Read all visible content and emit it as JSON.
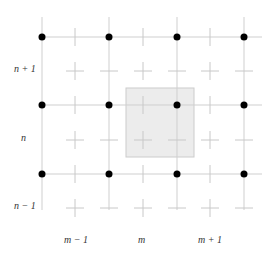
{
  "diagram": {
    "type": "staggered-grid",
    "row_labels": [
      "n + 1",
      "n",
      "n − 1"
    ],
    "column_labels": [
      "m − 1",
      "m",
      "m + 1"
    ],
    "node_columns_x": [
      42,
      109,
      177,
      244
    ],
    "node_rows_y": [
      37,
      105,
      174
    ],
    "cross_columns_x": [
      75,
      143,
      210
    ],
    "cross_rows_y": [
      71,
      140,
      208
    ],
    "highlight_cell": {
      "x": 126,
      "y": 88,
      "w": 68,
      "h": 69,
      "fill": "#ececec",
      "stroke": "#cccccc"
    },
    "colors": {
      "grid_line": "#cfcfcf",
      "node": "#000000",
      "cross": "#c8c8c8"
    }
  },
  "labels": {
    "row_n_plus_1": "n + 1",
    "row_n": "n",
    "row_n_minus_1": "n − 1",
    "col_m_minus_1": "m − 1",
    "col_m": "m",
    "col_m_plus_1": "m + 1"
  }
}
